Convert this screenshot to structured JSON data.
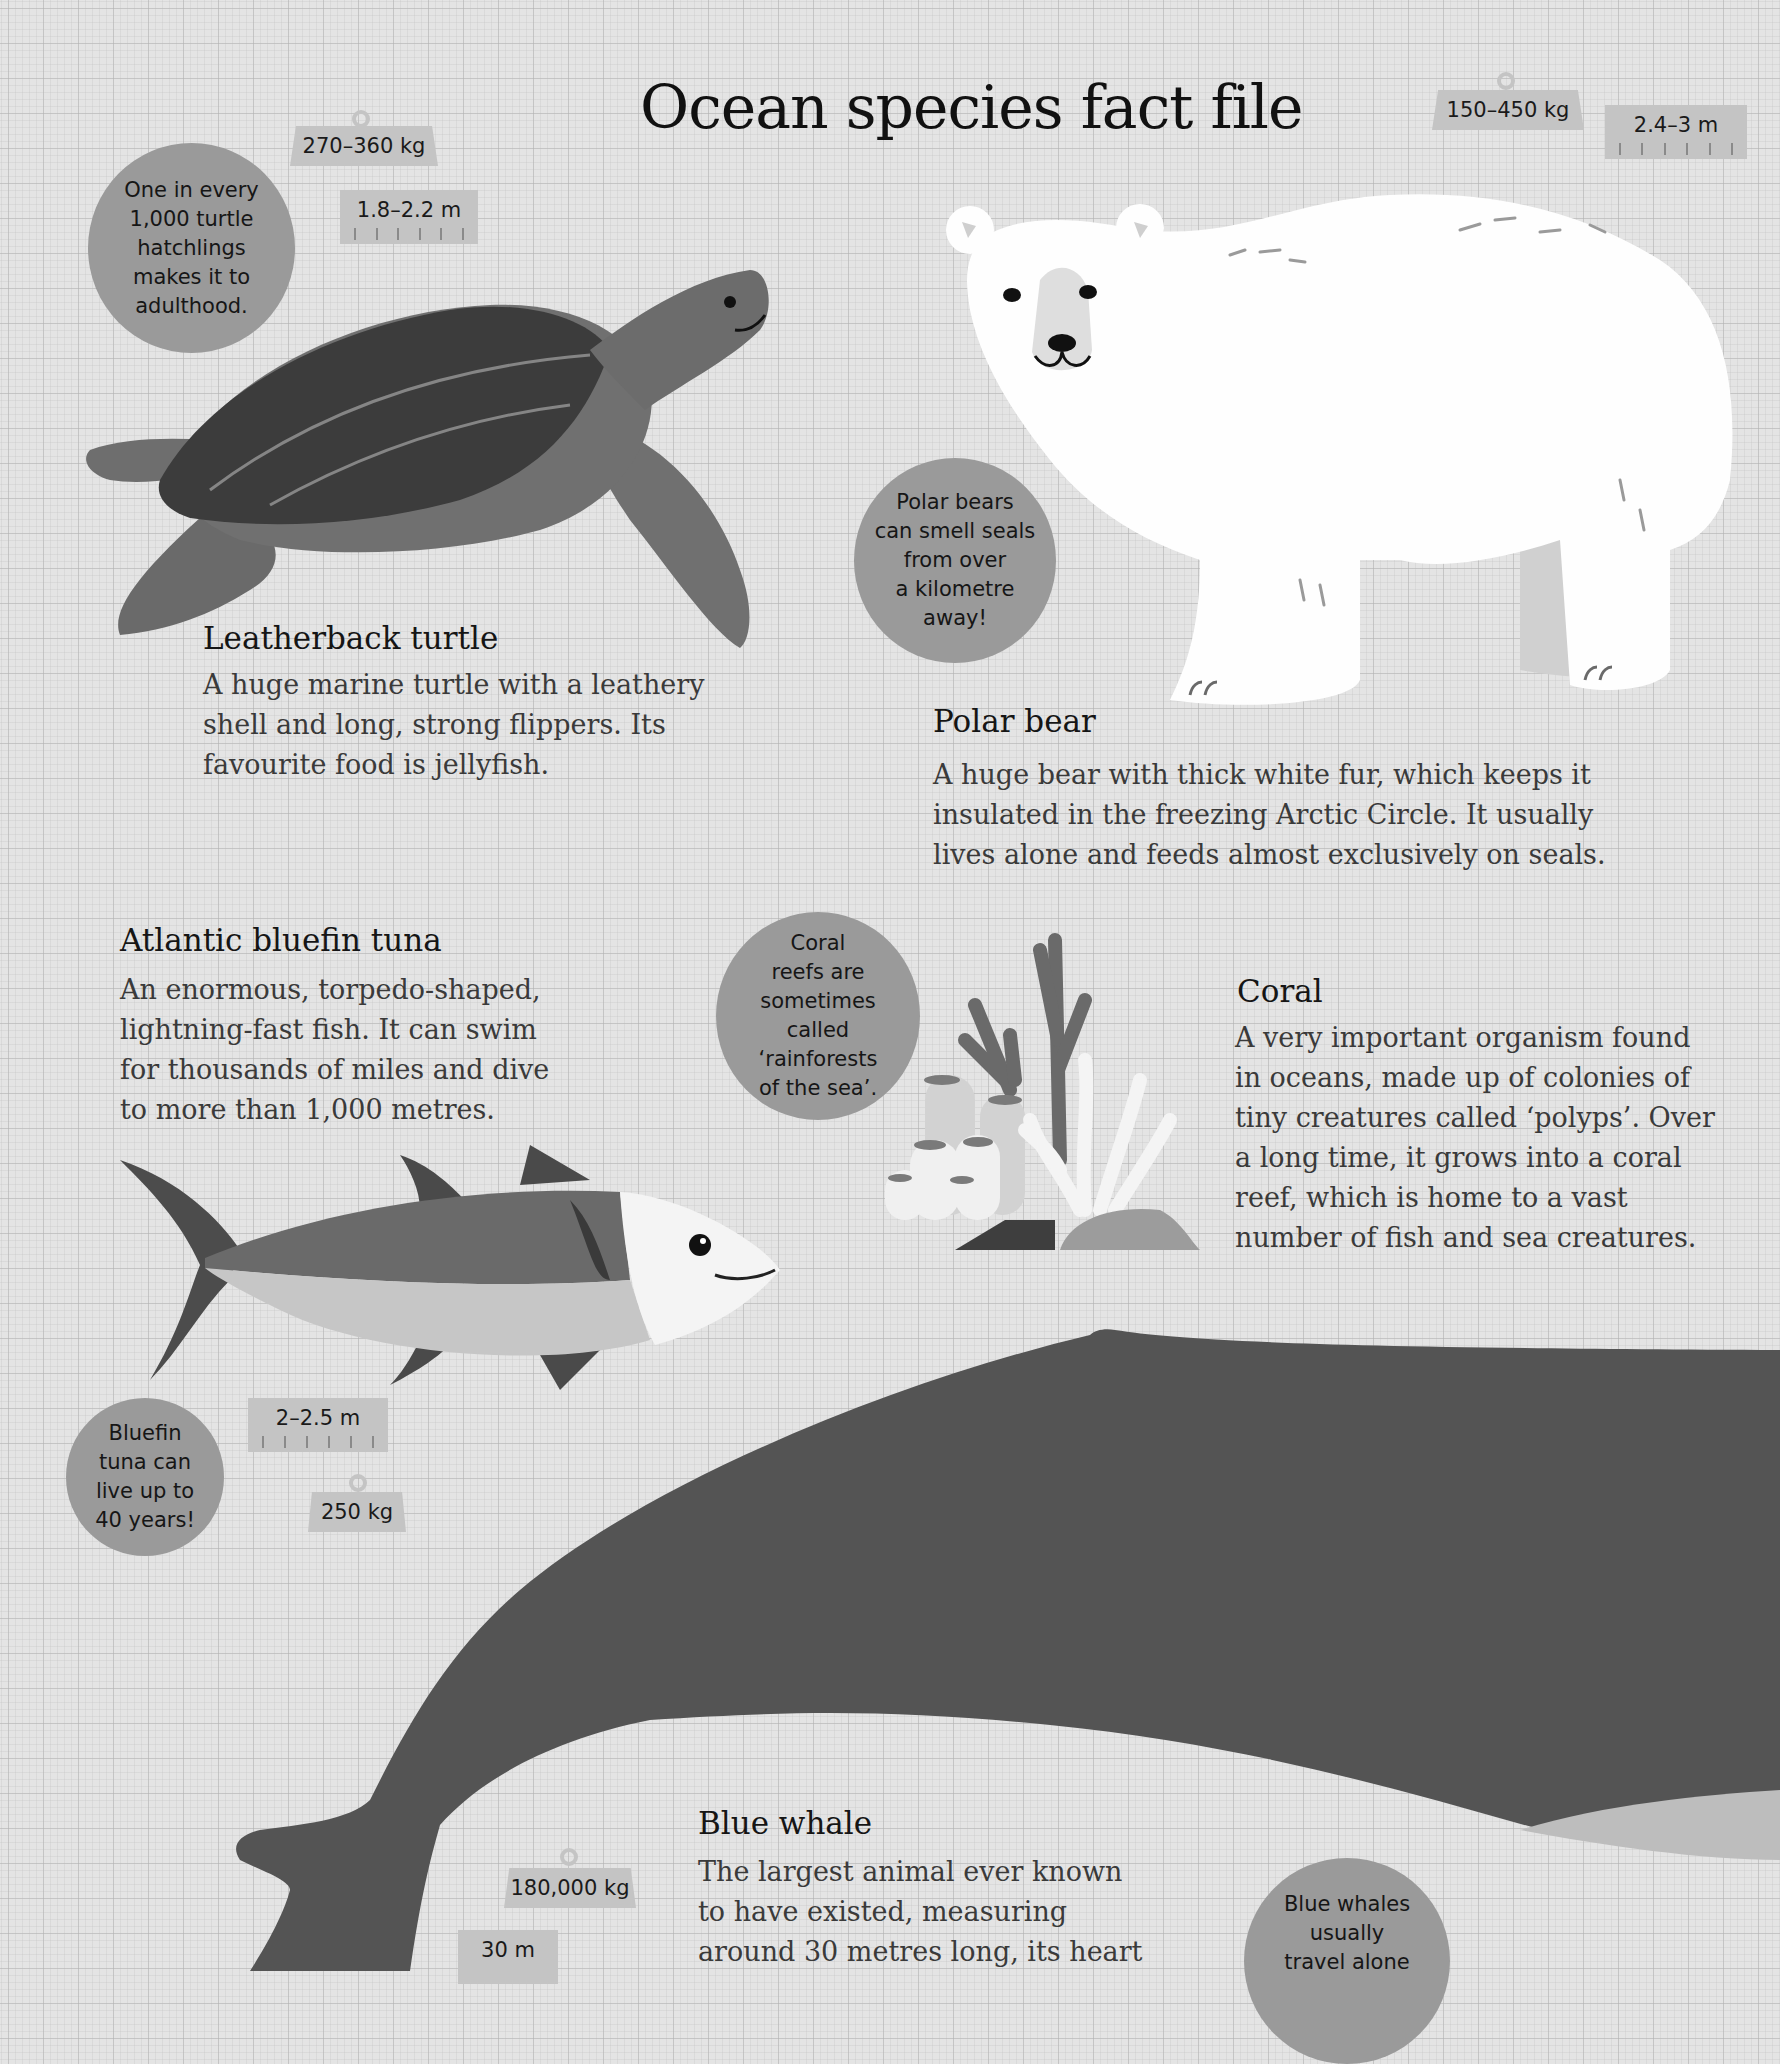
{
  "page": {
    "title": "Ocean species fact file"
  },
  "species": {
    "turtle": {
      "name": "Leatherback turtle",
      "description": "A huge marine turtle with a leathery shell and long, strong flippers. Its favourite food is jellyfish.",
      "weight": "270–360 kg",
      "length": "1.8–2.2 m",
      "fact": [
        "One in every",
        "1,000 turtle",
        "hatchlings",
        "makes it to",
        "adulthood."
      ]
    },
    "polar_bear": {
      "name": "Polar bear",
      "description": "A huge bear with thick white fur, which keeps it insulated in the freezing Arctic Circle. It usually lives alone and feeds almost exclusively on seals.",
      "weight": "150–450 kg",
      "length": "2.4–3 m",
      "fact": [
        "Polar bears",
        "can smell seals",
        "from over",
        "a kilometre",
        "away!"
      ]
    },
    "tuna": {
      "name": "Atlantic bluefin tuna",
      "description": "An enormous, torpedo-shaped, lightning-fast fish. It can swim for thousands of miles and dive to more than 1,000 metres.",
      "weight": "250 kg",
      "length": "2–2.5 m",
      "fact": [
        "Bluefin",
        "tuna can",
        "live up to",
        "40 years!"
      ]
    },
    "coral": {
      "name": "Coral",
      "description": "A very important organism found in oceans, made up of colonies of tiny creatures called ‘polyps’. Over a long time, it grows into a coral reef, which is home to a vast number of fish and sea creatures.",
      "fact": [
        "Coral",
        "reefs are",
        "sometimes",
        "called",
        "‘rainforests",
        "of the sea’."
      ]
    },
    "blue_whale": {
      "name": "Blue whale",
      "description_lines": [
        "The largest animal ever known",
        "to have existed, measuring",
        "around 30 metres long, its heart"
      ],
      "weight": "180,000 kg",
      "length": "30 m",
      "fact": [
        "Blue whales",
        "usually",
        "travel alone"
      ]
    }
  },
  "colors": {
    "paper": "#e4e4e4",
    "bubble": "#9a9a9a",
    "tag": "#c4c4c4",
    "whale": "#545454",
    "turtle_shell": "#3c3c3c",
    "turtle_skin": "#6e6e6e"
  }
}
